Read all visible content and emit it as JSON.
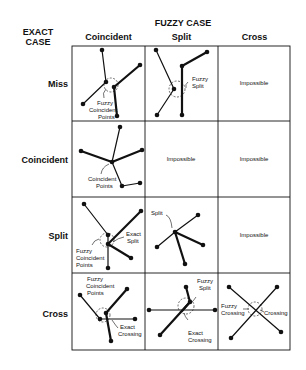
{
  "header": {
    "exact_case_line1": "EXACT",
    "exact_case_line2": "CASE",
    "fuzzy_case": "FUZZY CASE"
  },
  "columns": [
    "Coincident",
    "Split",
    "Cross"
  ],
  "rows": [
    "Miss",
    "Coincident",
    "Split",
    "Cross"
  ],
  "cells": {
    "miss_coincident": [
      "Fuzzy",
      "Coincident",
      "Points"
    ],
    "miss_split": [
      "Fuzzy",
      "Split"
    ],
    "miss_cross": "Impossible",
    "coincident_coincident": [
      "Coincident",
      "Points"
    ],
    "coincident_split": "Impossible",
    "coincident_cross": "Impossible",
    "split_coincident_fuzzy": [
      "Fuzzy",
      "Coincident",
      "Points"
    ],
    "split_coincident_exact": [
      "Exact",
      "Split"
    ],
    "split_split": "Split",
    "split_cross": "Impossible",
    "cross_coincident_fuzzy": [
      "Fuzzy",
      "Coincident",
      "Points"
    ],
    "cross_coincident_exact": [
      "Exact",
      "Crossing"
    ],
    "cross_split_fuzzy": [
      "Fuzzy",
      "Split"
    ],
    "cross_split_exact": [
      "Exact",
      "Crossing"
    ],
    "cross_cross_fuzzy": [
      "Fuzzy",
      "Crossing"
    ],
    "cross_cross_exact": "Crossing"
  },
  "colors": {
    "ink": "#111111",
    "background": "#ffffff"
  }
}
